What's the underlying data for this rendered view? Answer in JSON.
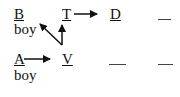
{
  "diagram": {
    "row1": {
      "nodes": [
        {
          "id": "B",
          "label": "B",
          "sublabel": "boy"
        },
        {
          "id": "T",
          "label": "T"
        },
        {
          "id": "D",
          "label": "D"
        }
      ],
      "blank": "—"
    },
    "row2": {
      "nodes": [
        {
          "id": "A",
          "label": "A",
          "sublabel": "boy"
        },
        {
          "id": "V",
          "label": "V"
        }
      ],
      "blanks": [
        "—",
        "—"
      ]
    },
    "edges": [
      {
        "from": "T",
        "to": "D"
      },
      {
        "from": "A",
        "to": "V"
      },
      {
        "from": "junction",
        "to": "B-boy"
      },
      {
        "from": "junction",
        "to": "T"
      }
    ],
    "colors": {
      "ink": "#111111",
      "blank": "#444444"
    }
  }
}
